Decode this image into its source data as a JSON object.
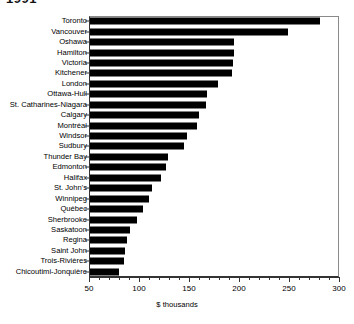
{
  "chart_data": {
    "type": "bar",
    "orientation": "horizontal",
    "title": "1991",
    "xlabel": "$ thousands",
    "ylabel": "",
    "xlim": [
      50,
      300
    ],
    "xticks": [
      50,
      100,
      150,
      200,
      250,
      300
    ],
    "xtick_labels": [
      "50",
      "100",
      "150",
      "200",
      "250",
      "300"
    ],
    "minor_tick_step": 10,
    "grid": false,
    "legend": null,
    "bar_color": "#000000",
    "categories": [
      "Toronto",
      "Vancouver",
      "Oshawa",
      "Hamilton",
      "Victoria",
      "Kitchener",
      "London",
      "Ottawa-Hull",
      "St. Catharines-Niagara",
      "Calgary",
      "Montréal",
      "Windsor",
      "Sudbury",
      "Thunder Bay",
      "Edmonton",
      "Halifax",
      "St. John's",
      "Winnipeg",
      "Québec",
      "Sherbrooke",
      "Saskatoon",
      "Regina",
      "Saint John",
      "Trois-Rivières",
      "Chicoutimi-Jonquière"
    ],
    "values": [
      281,
      249,
      195,
      195,
      194,
      193,
      179,
      168,
      167,
      160,
      158,
      148,
      145,
      129,
      127,
      122,
      113,
      110,
      104,
      98,
      91,
      88,
      86,
      85,
      80
    ]
  }
}
